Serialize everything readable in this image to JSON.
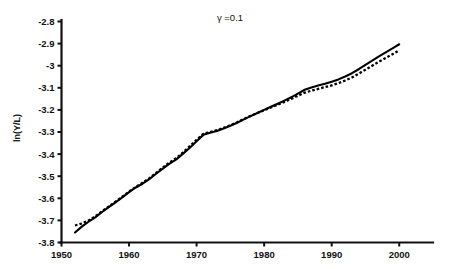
{
  "chart_data": {
    "type": "line",
    "title": "γ =0.1",
    "xlabel": "",
    "ylabel": "ln(Y/L)",
    "xlim": [
      1950,
      2005
    ],
    "ylim": [
      -3.8,
      -2.8
    ],
    "xticks": [
      1950,
      1960,
      1970,
      1980,
      1990,
      2000
    ],
    "xtick_labels": [
      "1950",
      "1960",
      "1970",
      "1980",
      "1990",
      "2000"
    ],
    "yticks": [
      -2.8,
      -2.9,
      -3.0,
      -3.1,
      -3.2,
      -3.3,
      -3.4,
      -3.5,
      -3.6,
      -3.7,
      -3.8
    ],
    "ytick_labels": [
      "-2.8",
      "-2.9",
      "-3",
      "-3.1",
      "-3.2",
      "-3.3",
      "-3.4",
      "-3.5",
      "-3.6",
      "-3.7",
      "-3.8"
    ],
    "grid": false,
    "legend": "none",
    "series": [
      {
        "name": "actual",
        "style": "solid",
        "color": "#000000",
        "x": [
          1952,
          1953,
          1954,
          1955,
          1956,
          1957,
          1958,
          1959,
          1960,
          1961,
          1962,
          1963,
          1964,
          1965,
          1966,
          1967,
          1968,
          1969,
          1970,
          1971,
          1972,
          1973,
          1974,
          1975,
          1976,
          1977,
          1978,
          1979,
          1980,
          1981,
          1982,
          1983,
          1984,
          1985,
          1986,
          1987,
          1988,
          1989,
          1990,
          1991,
          1992,
          1993,
          1994,
          1995,
          1996,
          1997,
          1998,
          1999,
          2000
        ],
        "y": [
          -3.755,
          -3.728,
          -3.706,
          -3.686,
          -3.662,
          -3.64,
          -3.618,
          -3.596,
          -3.572,
          -3.551,
          -3.534,
          -3.513,
          -3.489,
          -3.466,
          -3.443,
          -3.424,
          -3.398,
          -3.371,
          -3.342,
          -3.313,
          -3.303,
          -3.295,
          -3.284,
          -3.272,
          -3.258,
          -3.243,
          -3.228,
          -3.214,
          -3.2,
          -3.186,
          -3.172,
          -3.158,
          -3.143,
          -3.126,
          -3.109,
          -3.099,
          -3.09,
          -3.082,
          -3.073,
          -3.062,
          -3.049,
          -3.034,
          -3.016,
          -2.996,
          -2.977,
          -2.958,
          -2.94,
          -2.922,
          -2.903
        ]
      },
      {
        "name": "fitted",
        "style": "dashed",
        "color": "#000000",
        "x": [
          1952,
          1953,
          1954,
          1955,
          1956,
          1957,
          1958,
          1959,
          1960,
          1961,
          1962,
          1963,
          1964,
          1965,
          1966,
          1967,
          1968,
          1969,
          1970,
          1971,
          1972,
          1973,
          1974,
          1975,
          1976,
          1977,
          1978,
          1979,
          1980,
          1981,
          1982,
          1983,
          1984,
          1985,
          1986,
          1987,
          1988,
          1989,
          1990,
          1991,
          1992,
          1993,
          1994,
          1995,
          1996,
          1997,
          1998,
          1999,
          2000
        ],
        "y": [
          -3.723,
          -3.714,
          -3.7,
          -3.682,
          -3.659,
          -3.637,
          -3.615,
          -3.593,
          -3.57,
          -3.548,
          -3.53,
          -3.509,
          -3.485,
          -3.461,
          -3.438,
          -3.418,
          -3.392,
          -3.364,
          -3.335,
          -3.308,
          -3.3,
          -3.292,
          -3.281,
          -3.269,
          -3.256,
          -3.241,
          -3.227,
          -3.214,
          -3.201,
          -3.189,
          -3.177,
          -3.164,
          -3.15,
          -3.136,
          -3.122,
          -3.113,
          -3.105,
          -3.097,
          -3.089,
          -3.079,
          -3.067,
          -3.053,
          -3.036,
          -3.018,
          -3.0,
          -2.982,
          -2.965,
          -2.948,
          -2.93
        ]
      }
    ]
  },
  "title": {
    "text": "γ =0.1"
  },
  "yaxis": {
    "label": "ln(Y/L)"
  }
}
